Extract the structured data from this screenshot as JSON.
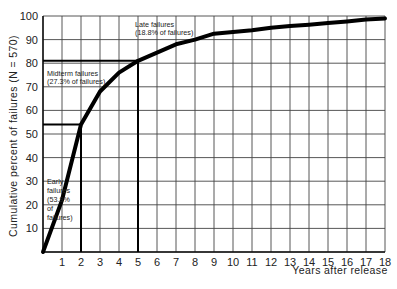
{
  "chart_data": {
    "type": "line",
    "title": "",
    "xlabel": "Years after release",
    "ylabel": "Cumulative percent of failures (N = 570)",
    "xlim": [
      0,
      18
    ],
    "ylim": [
      0,
      100
    ],
    "grid": true,
    "legend": null,
    "x_ticks": [
      1,
      2,
      3,
      4,
      5,
      6,
      7,
      8,
      9,
      10,
      11,
      12,
      13,
      14,
      15,
      16,
      17,
      18
    ],
    "y_ticks": [
      10,
      20,
      30,
      40,
      50,
      60,
      70,
      80,
      90,
      100
    ],
    "series": [
      {
        "name": "Cumulative percent of failures",
        "x": [
          0,
          1,
          2,
          3,
          4,
          5,
          6,
          7,
          8,
          9,
          10,
          11,
          12,
          13,
          14,
          15,
          16,
          17,
          18
        ],
        "values": [
          0,
          22,
          54,
          68,
          76,
          81,
          84.5,
          88,
          90,
          92.5,
          93.2,
          94,
          95,
          95.8,
          96.3,
          97,
          97.7,
          98.5,
          99
        ]
      }
    ],
    "reference_lines": [
      {
        "type": "vertical",
        "x": 2,
        "to_y": 54
      },
      {
        "type": "horizontal",
        "y": 54,
        "to_x": 2
      },
      {
        "type": "vertical",
        "x": 5,
        "to_y": 81
      },
      {
        "type": "horizontal",
        "y": 81,
        "to_x": 5
      }
    ],
    "annotations": [
      {
        "lines": [
          "Early",
          "failures",
          "(53.9%",
          "of",
          "failures)"
        ],
        "region": "early"
      },
      {
        "lines": [
          "Midterm failures",
          "(27.3% of failures)"
        ],
        "region": "midterm"
      },
      {
        "lines": [
          "Late failures",
          "(18.8% of failures)"
        ],
        "region": "late"
      }
    ]
  },
  "labels": {
    "xlabel": "Years after release",
    "ylabel": "Cumulative percent of failures (N = 570)",
    "early_1": "Early",
    "early_2": "failures",
    "early_3": "(53.9%",
    "early_4": "of",
    "early_5": "failures)",
    "mid_1": "Midterm failures",
    "mid_2": "(27.3% of failures)",
    "late_1": "Late failures",
    "late_2": "(18.8% of failures)"
  }
}
